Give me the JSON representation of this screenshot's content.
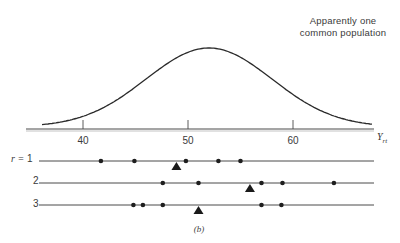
{
  "annotation": {
    "line1": "Apparently one",
    "line2": "common population"
  },
  "axis": {
    "label_main": "Y",
    "label_sub": "rt",
    "ticks": [
      {
        "value": 40,
        "label": "40"
      },
      {
        "value": 50,
        "label": "50"
      },
      {
        "value": 60,
        "label": "60"
      }
    ]
  },
  "rows": {
    "prefix": "r =",
    "labels": [
      "1",
      "2",
      "3"
    ]
  },
  "caption": "(b)",
  "chart_data": {
    "type": "scatter",
    "title": "",
    "annotation": "Apparently one common population",
    "xlabel": "Y_rt",
    "ylabel": "",
    "xlim": [
      35.6,
      67.3
    ],
    "x_ticks": [
      40,
      50,
      60
    ],
    "grid": false,
    "legend": null,
    "density_curve": {
      "shape": "normal",
      "mean": 52,
      "sd": 6,
      "description": "Single bell-shaped population density curve peaked near 52"
    },
    "series": [
      {
        "name": "r = 1",
        "points": [
          41.7,
          44.9,
          49.8,
          52.9,
          55.0
        ],
        "mean_marker": 48.9
      },
      {
        "name": "r = 2",
        "points": [
          47.6,
          51.0,
          57.0,
          59.0,
          63.9
        ],
        "mean_marker": 55.9
      },
      {
        "name": "r = 3",
        "points": [
          44.8,
          45.7,
          47.6,
          57.0,
          58.9
        ],
        "mean_marker": 51.0
      }
    ],
    "caption": "(b)"
  }
}
